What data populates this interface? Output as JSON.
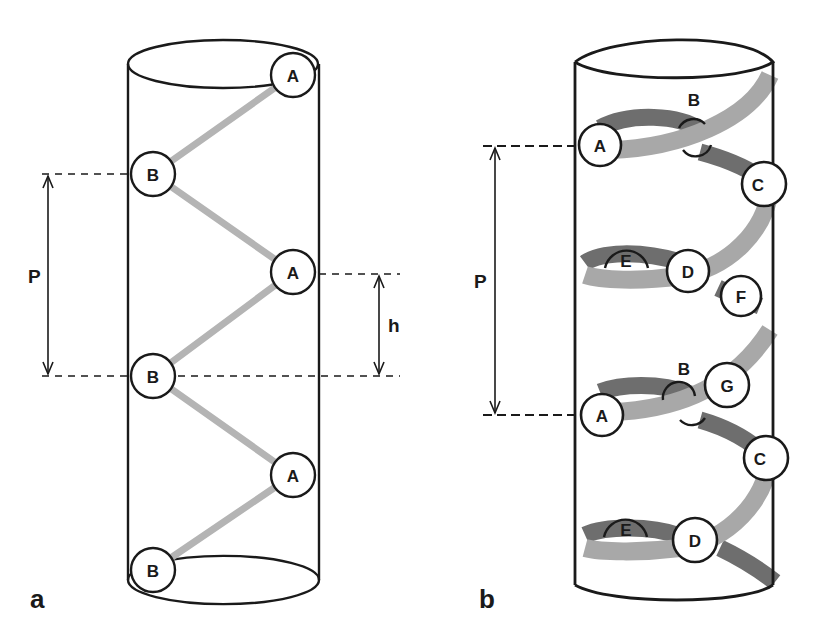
{
  "figure": {
    "panels": [
      {
        "id": "a",
        "label": "a",
        "nodes": [
          "A",
          "B",
          "A",
          "B",
          "A",
          "B"
        ],
        "dimensions": {
          "pitch_label": "P",
          "rise_label": "h"
        }
      },
      {
        "id": "b",
        "label": "b",
        "nodes": [
          "A",
          "B",
          "C",
          "E",
          "D",
          "F",
          "A",
          "B",
          "G",
          "C",
          "E",
          "D"
        ],
        "dimensions": {
          "pitch_label": "P"
        }
      }
    ],
    "colors": {
      "outline": "#1a1a1a",
      "strand_front": "#a8a8a8",
      "strand_back": "#6e6e6e",
      "link": "#b4b4b4"
    }
  }
}
